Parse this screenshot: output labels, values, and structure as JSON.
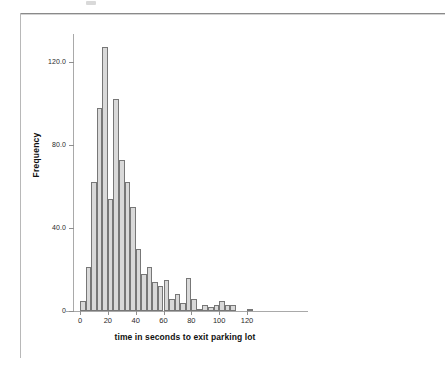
{
  "figure": {
    "kind": "spss-histogram",
    "background": "#ffffff"
  },
  "chart_data": {
    "type": "bar",
    "title": "",
    "subtitle": "",
    "xlabel": "time in seconds to exit parking lot",
    "ylabel": "Frequency",
    "xlim": [
      -2,
      126
    ],
    "ylim": [
      0,
      132
    ],
    "grid": false,
    "legend": null,
    "bin_width": 4,
    "x_ticks": [
      0,
      20,
      40,
      60,
      80,
      100,
      120
    ],
    "x_tick_labels": [
      "0",
      "20",
      "40",
      "60",
      "80",
      "100",
      "120"
    ],
    "y_ticks": [
      0,
      40,
      80,
      120
    ],
    "y_tick_labels": [
      "0",
      "40.0",
      "80.0",
      "120.0"
    ],
    "bar_fill": "#d9d9d9",
    "bar_edge": "#777777",
    "axis_color": "#a9a9a9",
    "bin_starts": [
      0,
      4,
      8,
      12,
      16,
      20,
      24,
      28,
      32,
      36,
      40,
      44,
      48,
      52,
      56,
      60,
      64,
      68,
      72,
      76,
      80,
      84,
      88,
      92,
      96,
      100,
      104,
      108,
      112,
      116,
      120
    ],
    "categories": [
      "0-4",
      "4-8",
      "8-12",
      "12-16",
      "16-20",
      "20-24",
      "24-28",
      "28-32",
      "32-36",
      "36-40",
      "40-44",
      "44-48",
      "48-52",
      "52-56",
      "56-60",
      "60-64",
      "64-68",
      "68-72",
      "72-76",
      "76-80",
      "80-84",
      "84-88",
      "88-92",
      "92-96",
      "96-100",
      "100-104",
      "104-108",
      "108-112",
      "112-116",
      "116-120",
      "120-124"
    ],
    "values": [
      5,
      21,
      62,
      98,
      127,
      54,
      102,
      73,
      62,
      50,
      30,
      18,
      21,
      14,
      12,
      15,
      6,
      8,
      4,
      16,
      6,
      1,
      3,
      2,
      3,
      5,
      3,
      3,
      0,
      0,
      1
    ]
  },
  "axis": {
    "x_title": "time in seconds to exit parking lot",
    "y_title": "Frequency"
  }
}
